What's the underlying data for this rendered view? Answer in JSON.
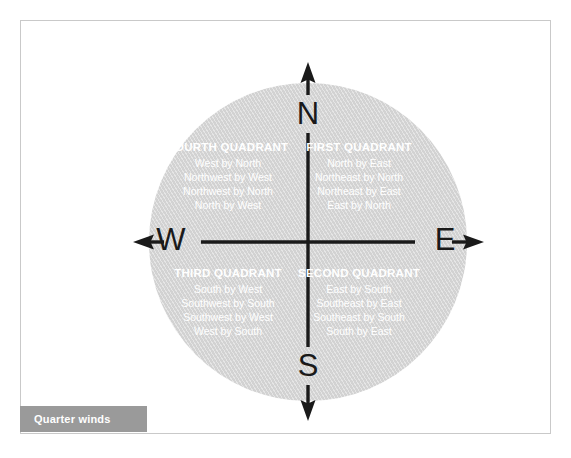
{
  "figure": {
    "caption": "Quarter winds",
    "disc_color": "#d2d2d2",
    "axis_color": "#1a1a1a",
    "text_color": "#ffffff",
    "caption_bar_color": "#9a9a9a",
    "frame_color": "#c9c9c9"
  },
  "compass": {
    "cardinals": {
      "north": "N",
      "south": "S",
      "west": "W",
      "east": "E"
    },
    "quadrants": [
      {
        "key": "fourth",
        "title": "FOURTH QUADRANT",
        "winds": [
          "West by North",
          "Northwest by West",
          "Northwest by North",
          "North by West"
        ]
      },
      {
        "key": "first",
        "title": "FIRST QUADRANT",
        "winds": [
          "North by East",
          "Northeast by North",
          "Northeast by East",
          "East by North"
        ]
      },
      {
        "key": "third",
        "title": "THIRD QUADRANT",
        "winds": [
          "South by West",
          "Southwest by South",
          "Southwest by West",
          "West by South"
        ]
      },
      {
        "key": "second",
        "title": "SECOND QUADRANT",
        "winds": [
          "East by South",
          "Southeast by East",
          "Southeast by South",
          "South by East"
        ]
      }
    ]
  }
}
